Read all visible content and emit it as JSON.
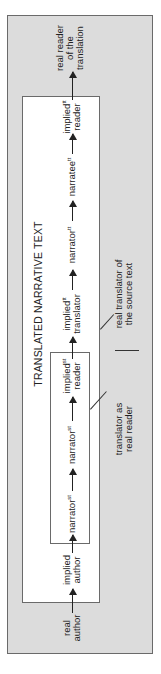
{
  "diagram": {
    "title": "TRANSLATED NARRATIVE TEXT",
    "nodes": [
      {
        "id": "real-author",
        "line1": "real",
        "line2": "author",
        "sup": ""
      },
      {
        "id": "implied-author",
        "line1": "implied",
        "line2": "author",
        "sup": ""
      },
      {
        "id": "narrator-st",
        "line1": "narrator",
        "line2": "",
        "sup": "st"
      },
      {
        "id": "narratee-st",
        "line1": "narrator",
        "line2": "",
        "sup": "st"
      },
      {
        "id": "implied-reader-st",
        "line1": "implied",
        "line2": "reader",
        "sup": "st"
      },
      {
        "id": "implied-translator-tt",
        "line1": "implied",
        "line2": "translator",
        "sup": "tt"
      },
      {
        "id": "narrator-tt",
        "line1": "narrator",
        "line2": "",
        "sup": "tt"
      },
      {
        "id": "narratee-tt",
        "line1": "narratee",
        "line2": "",
        "sup": "tt"
      },
      {
        "id": "implied-reader-tt",
        "line1": "implied",
        "line2": "reader",
        "sup": "tt"
      },
      {
        "id": "real-reader-translation",
        "line1": "real reader",
        "line2": "of the",
        "line3": "translation",
        "sup": ""
      }
    ],
    "gray_labels": {
      "translator_as_reader": {
        "line1": "translator as",
        "line2": "real reader"
      },
      "real_translator": {
        "line1": "real translator of",
        "line2": "the source text"
      }
    },
    "colors": {
      "outer_fill": "#dcdcdc",
      "box_fill": "#ffffff",
      "stroke": "#6a6a6a",
      "text": "#222222"
    },
    "orientation": "rotated -90deg"
  }
}
